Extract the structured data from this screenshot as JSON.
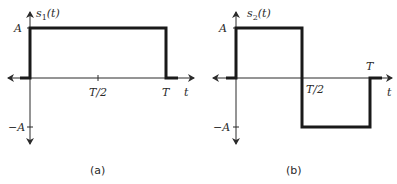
{
  "figures": [
    {
      "id": "a",
      "caption": "(a)",
      "ylabel_fn": "s",
      "ylabel_sub": "1",
      "ylabel_arg": "(t)",
      "y_ticks": [
        "A",
        "−A"
      ],
      "x_ticks": [
        "T/2",
        "T"
      ],
      "xlabel": "t",
      "signal": "rectangular pulse: A for 0<t<T, 0 elsewhere"
    },
    {
      "id": "b",
      "caption": "(b)",
      "ylabel_fn": "s",
      "ylabel_sub": "2",
      "ylabel_arg": "(t)",
      "y_ticks": [
        "A",
        "−A"
      ],
      "x_ticks": [
        "T/2",
        "T"
      ],
      "xlabel": "t",
      "signal": "A for 0<t<T/2, −A for T/2<t<T, 0 elsewhere"
    }
  ]
}
